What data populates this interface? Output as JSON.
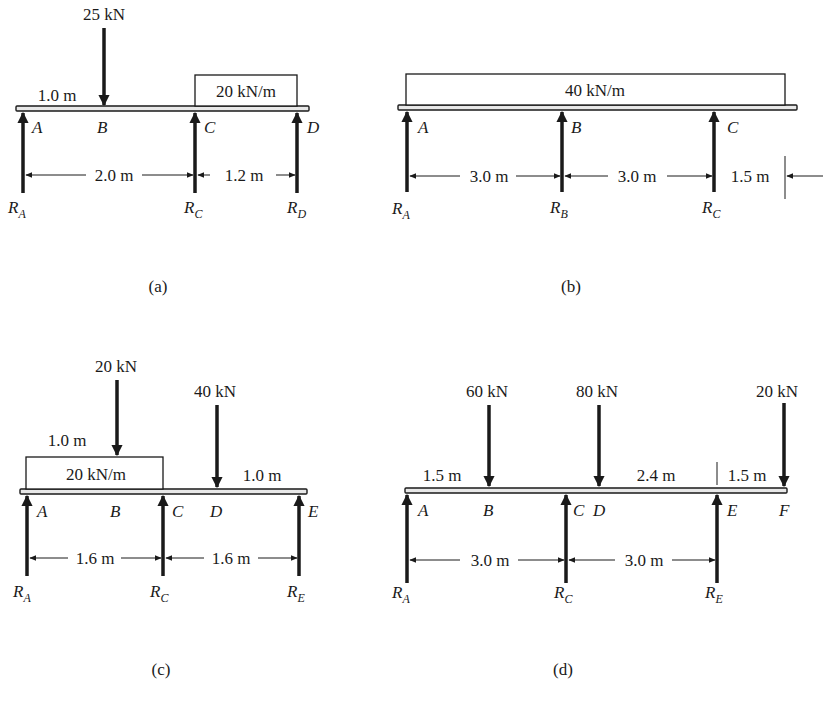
{
  "figure": {
    "panels": [
      {
        "id": "a",
        "caption": "(a)",
        "point_load": "25 kN",
        "point_load_offset": "1.0 m",
        "distributed_load": "20 kN/m",
        "points": [
          "A",
          "B",
          "C",
          "D"
        ],
        "reactions": [
          {
            "symbol": "R",
            "sub": "A"
          },
          {
            "symbol": "R",
            "sub": "C"
          },
          {
            "symbol": "R",
            "sub": "D"
          }
        ],
        "spans": [
          "2.0 m",
          "1.2 m"
        ]
      },
      {
        "id": "b",
        "caption": "(b)",
        "distributed_load": "40 kN/m",
        "points": [
          "A",
          "B",
          "C"
        ],
        "reactions": [
          {
            "symbol": "R",
            "sub": "A"
          },
          {
            "symbol": "R",
            "sub": "B"
          },
          {
            "symbol": "R",
            "sub": "C"
          }
        ],
        "spans": [
          "3.0 m",
          "3.0 m",
          "1.5 m"
        ]
      },
      {
        "id": "c",
        "caption": "(c)",
        "point_loads": [
          "20 kN",
          "40 kN"
        ],
        "point_load_offsets": [
          "1.0 m",
          "1.0 m"
        ],
        "distributed_load": "20 kN/m",
        "points": [
          "A",
          "B",
          "C",
          "D",
          "E"
        ],
        "reactions": [
          {
            "symbol": "R",
            "sub": "A"
          },
          {
            "symbol": "R",
            "sub": "C"
          },
          {
            "symbol": "R",
            "sub": "E"
          }
        ],
        "spans": [
          "1.6 m",
          "1.6 m"
        ]
      },
      {
        "id": "d",
        "caption": "(d)",
        "point_loads": [
          "60 kN",
          "80 kN",
          "20 kN"
        ],
        "point_load_offsets": [
          "1.5 m",
          "2.4 m",
          "1.5 m"
        ],
        "points": [
          "A",
          "B",
          "C",
          "D",
          "E",
          "F"
        ],
        "reactions": [
          {
            "symbol": "R",
            "sub": "A"
          },
          {
            "symbol": "R",
            "sub": "C"
          },
          {
            "symbol": "R",
            "sub": "E"
          }
        ],
        "spans": [
          "3.0 m",
          "3.0 m"
        ]
      }
    ]
  }
}
